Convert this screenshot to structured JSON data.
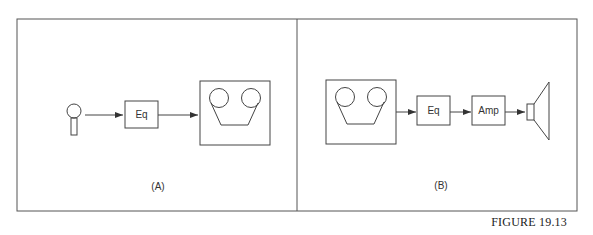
{
  "figure": {
    "caption": "FIGURE 19.13",
    "panels": [
      {
        "id": "A",
        "label": "(A)",
        "chain": [
          "microphone",
          "Eq",
          "tape-recorder"
        ],
        "blocks": {
          "eq": "Eq"
        }
      },
      {
        "id": "B",
        "label": "(B)",
        "chain": [
          "tape-recorder",
          "Eq",
          "Amp",
          "loudspeaker"
        ],
        "blocks": {
          "eq": "Eq",
          "amp": "Amp"
        }
      }
    ]
  },
  "colors": {
    "line": "#444444",
    "background": "#ffffff"
  }
}
